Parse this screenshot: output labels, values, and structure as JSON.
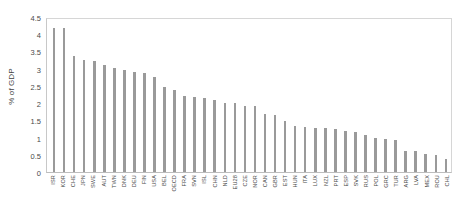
{
  "chart_data": {
    "type": "bar",
    "title": "",
    "subtitle": "",
    "xlabel": "",
    "ylabel": "% of GDP",
    "ylim": [
      0,
      4.5
    ],
    "yticks": [
      "0",
      "0.5",
      "1",
      "1.5",
      "2",
      "2.5",
      "3",
      "3.5",
      "4",
      "4.5"
    ],
    "ytick_values": [
      0,
      0.5,
      1,
      1.5,
      2,
      2.5,
      3,
      3.5,
      4,
      4.5
    ],
    "grid": false,
    "legend": "none",
    "bar_color": "#9a9a9a",
    "categories": [
      "ISR",
      "KOR",
      "CHE",
      "JPN",
      "SWE",
      "AUT",
      "TWN",
      "DNK",
      "DEU",
      "FIN",
      "USA",
      "BEL",
      "OECD",
      "FRA",
      "SVN",
      "ISL",
      "CHN",
      "NLD",
      "EU28",
      "CZE",
      "NOR",
      "CAN",
      "GBR",
      "EST",
      "HUN",
      "ITA",
      "LUX",
      "NZL",
      "PRT",
      "ESP",
      "SVK",
      "RUS",
      "POL",
      "GRC",
      "TUR",
      "ARG",
      "LVA",
      "MEX",
      "ROU",
      "CHL"
    ],
    "values": [
      4.25,
      4.23,
      3.42,
      3.28,
      3.26,
      3.16,
      3.05,
      3.01,
      2.94,
      2.9,
      2.79,
      2.49,
      2.4,
      2.25,
      2.21,
      2.19,
      2.12,
      2.03,
      2.03,
      1.93,
      1.93,
      1.71,
      1.69,
      1.5,
      1.35,
      1.33,
      1.29,
      1.28,
      1.27,
      1.22,
      1.18,
      1.1,
      1.0,
      0.96,
      0.94,
      0.61,
      0.62,
      0.53,
      0.5,
      0.38
    ]
  }
}
